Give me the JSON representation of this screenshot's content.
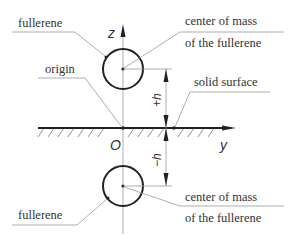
{
  "diagram": {
    "labels": {
      "top_fullerene": "fullerene",
      "origin": "origin",
      "top_center_line1": "center of mass",
      "top_center_line2": "of the fullerene",
      "solid_surface": "solid surface",
      "bottom_fullerene": "fullerene",
      "bottom_center_line1": "center of mass",
      "bottom_center_line2": "of the fullerene"
    },
    "axes": {
      "z_label": "z",
      "y_label": "y",
      "origin_label": "O"
    },
    "dimensions": {
      "plus_h": "+h",
      "minus_h": "−h"
    },
    "colors": {
      "line": "#222222",
      "leader": "#9a9a9a",
      "text": "#333333"
    }
  }
}
